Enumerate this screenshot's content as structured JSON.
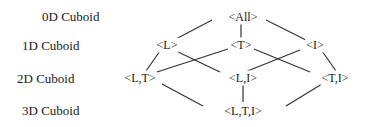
{
  "levels": [
    {
      "label": "0D Cuboid"
    },
    {
      "label": "1D Cuboid"
    },
    {
      "label": "2D Cuboid"
    },
    {
      "label": "3D Cuboid"
    }
  ],
  "nodes": {
    "all": "<All>",
    "l": "<L>",
    "t": "<T>",
    "i": "<I>",
    "lt": "<L,T>",
    "li": "<L,I>",
    "ti": "<T,I>",
    "lti": "<L,T,I>"
  },
  "edges": [
    [
      "all",
      "l"
    ],
    [
      "all",
      "t"
    ],
    [
      "all",
      "i"
    ],
    [
      "l",
      "lt"
    ],
    [
      "l",
      "li"
    ],
    [
      "t",
      "lt"
    ],
    [
      "t",
      "ti"
    ],
    [
      "i",
      "li"
    ],
    [
      "i",
      "ti"
    ],
    [
      "lt",
      "lti"
    ],
    [
      "li",
      "lti"
    ],
    [
      "ti",
      "lti"
    ]
  ]
}
